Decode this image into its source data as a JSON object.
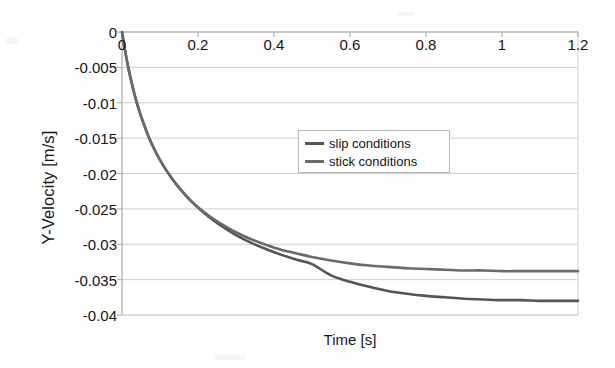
{
  "chart_data": {
    "type": "line",
    "title": "",
    "xlabel": "Time [s]",
    "ylabel": "Y-Velocity [m/s]",
    "xlim": [
      0,
      1.2
    ],
    "ylim": [
      -0.04,
      0
    ],
    "grid": true,
    "x_axis_position": "top",
    "legend_position": "upper-center",
    "xticks": [
      0,
      0.2,
      0.4,
      0.6,
      0.8,
      1,
      1.2
    ],
    "xtick_labels": [
      "0",
      "0.2",
      "0.4",
      "0.6",
      "0.8",
      "1",
      "1.2"
    ],
    "yticks": [
      0,
      -0.005,
      -0.01,
      -0.015,
      -0.02,
      -0.025,
      -0.03,
      -0.035,
      -0.04
    ],
    "ytick_labels": [
      "0",
      "-0.005",
      "-0.01",
      "-0.015",
      "-0.02",
      "-0.025",
      "-0.03",
      "-0.035",
      "-0.04"
    ],
    "x": [
      0,
      0.01,
      0.02,
      0.03,
      0.04,
      0.05,
      0.07,
      0.09,
      0.11,
      0.13,
      0.15,
      0.18,
      0.21,
      0.24,
      0.27,
      0.3,
      0.34,
      0.38,
      0.42,
      0.46,
      0.5,
      0.55,
      0.6,
      0.65,
      0.7,
      0.75,
      0.8,
      0.85,
      0.9,
      0.95,
      1.0,
      1.05,
      1.1,
      1.15,
      1.2
    ],
    "series": [
      {
        "name": "slip conditions",
        "color": "#555555",
        "values": [
          0,
          -0.0032,
          -0.0059,
          -0.0082,
          -0.0102,
          -0.0119,
          -0.0148,
          -0.0171,
          -0.019,
          -0.0206,
          -0.022,
          -0.0238,
          -0.0253,
          -0.0266,
          -0.0277,
          -0.0287,
          -0.0298,
          -0.0307,
          -0.0315,
          -0.0322,
          -0.0328,
          -0.0344,
          -0.0353,
          -0.036,
          -0.0366,
          -0.037,
          -0.0373,
          -0.0375,
          -0.0377,
          -0.0378,
          -0.0379,
          -0.0379,
          -0.038,
          -0.038,
          -0.038
        ]
      },
      {
        "name": "stick conditions",
        "color": "#6a6a6a",
        "values": [
          0,
          -0.0032,
          -0.0059,
          -0.0082,
          -0.0102,
          -0.0119,
          -0.0148,
          -0.0171,
          -0.019,
          -0.0206,
          -0.022,
          -0.0238,
          -0.0252,
          -0.0264,
          -0.0274,
          -0.0283,
          -0.0293,
          -0.0301,
          -0.0308,
          -0.0313,
          -0.0318,
          -0.0323,
          -0.0327,
          -0.033,
          -0.0332,
          -0.0334,
          -0.0335,
          -0.0336,
          -0.0337,
          -0.0337,
          -0.0338,
          -0.0338,
          -0.0338,
          -0.0338,
          -0.0338
        ]
      }
    ],
    "annotations": {
      "slip_plateau": -0.038,
      "stick_plateau": -0.0338
    }
  },
  "legend": {
    "entries": [
      {
        "label": "slip conditions"
      },
      {
        "label": "stick conditions"
      }
    ]
  },
  "axes": {
    "x_title": "Time [s]",
    "y_title": "Y-Velocity [m/s]"
  },
  "colors": {
    "slip": "#555555",
    "stick": "#6a6a6a",
    "grid": "#d0d0d0",
    "axis": "#bdbdbd",
    "text": "#151515",
    "background": "#ffffff"
  }
}
